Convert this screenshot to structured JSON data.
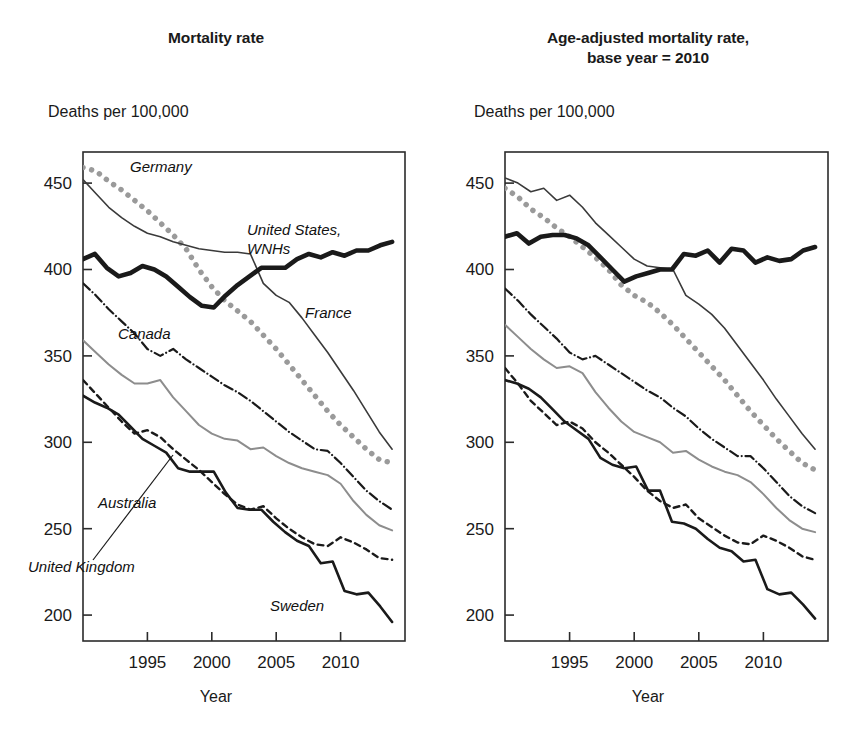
{
  "figure": {
    "width": 864,
    "height": 742,
    "background": "#ffffff"
  },
  "panels": [
    {
      "id": "left",
      "title_line1": "Mortality rate",
      "title_line2": "",
      "y_caption": "Deaths per 100,000",
      "x_caption": "Year"
    },
    {
      "id": "right",
      "title_line1": "Age-adjusted mortality rate,",
      "title_line2": "base year = 2010",
      "y_caption": "Deaths per 100,000",
      "x_caption": "Year"
    }
  ],
  "annotations": {
    "left": [
      {
        "name": "germany",
        "text": "Germany",
        "x": 130,
        "y": 172
      },
      {
        "name": "united-states-wnhs-1",
        "text": "United States,",
        "x": 247,
        "y": 235
      },
      {
        "name": "united-states-wnhs-2",
        "text": "WNHs",
        "x": 247,
        "y": 254
      },
      {
        "name": "france",
        "text": "France",
        "x": 305,
        "y": 318
      },
      {
        "name": "canada",
        "text": "Canada",
        "x": 118,
        "y": 339
      },
      {
        "name": "australia",
        "text": "Australia",
        "x": 98,
        "y": 508
      },
      {
        "name": "united-kingdom",
        "text": "United Kingdom",
        "x": 28,
        "y": 572
      },
      {
        "name": "sweden",
        "text": "Sweden",
        "x": 270,
        "y": 611
      }
    ],
    "right": []
  },
  "axes": {
    "y_ticks": [
      200,
      250,
      300,
      350,
      400,
      450
    ],
    "y_min": 185,
    "y_max": 468,
    "x_ticks": [
      1995,
      2000,
      2005,
      2010
    ],
    "x_min": 1990,
    "x_max": 2015,
    "grid": false,
    "legend_position": "inline-annotations"
  },
  "colors": {
    "black": "#1a1a1a",
    "gray": "#8d8d8d",
    "gray_dot": "#9a9a9a",
    "frame": "#2b2b2b"
  },
  "chart_data": [
    {
      "id": "mortality-rate",
      "type": "line",
      "title": "Mortality rate",
      "xlabel": "Year",
      "ylabel": "Deaths per 100,000",
      "xlim": [
        1990,
        2015
      ],
      "ylim": [
        185,
        468
      ],
      "x": [
        1990,
        1991,
        1992,
        1993,
        1994,
        1995,
        1996,
        1997,
        1998,
        1999,
        2000,
        2001,
        2002,
        2003,
        2004,
        2005,
        2006,
        2007,
        2008,
        2009,
        2010,
        2011,
        2012,
        2013,
        2014
      ],
      "grid": false,
      "series": [
        {
          "name": "Germany",
          "style": "dotted",
          "color": "#9a9a9a",
          "width": 5.5,
          "values": [
            459,
            457,
            451,
            446,
            440,
            434,
            427,
            420,
            412,
            400,
            390,
            382,
            376,
            370,
            362,
            354,
            345,
            336,
            327,
            318,
            310,
            303,
            296,
            290,
            288
          ]
        },
        {
          "name": "France",
          "style": "solid",
          "color": "#3a3a3a",
          "width": 1.6,
          "values": [
            452,
            444,
            436,
            430,
            425,
            421,
            419,
            416,
            414,
            412,
            411,
            410,
            410,
            409,
            392,
            385,
            381,
            372,
            362,
            352,
            341,
            330,
            318,
            306,
            296
          ]
        },
        {
          "name": "United States, WNHs",
          "style": "solid",
          "color": "#1a1a1a",
          "width": 4.6,
          "values": [
            406,
            409,
            401,
            396,
            398,
            402,
            400,
            396,
            390,
            384,
            379,
            378,
            385,
            391,
            396,
            401,
            401,
            401,
            406,
            409,
            407,
            410,
            408,
            411,
            411,
            414,
            416
          ]
        },
        {
          "name": "Canada",
          "style": "dashdot",
          "color": "#1a1a1a",
          "width": 2.2,
          "values": [
            392,
            385,
            377,
            370,
            363,
            354,
            350,
            354,
            348,
            343,
            338,
            333,
            329,
            324,
            318,
            312,
            306,
            301,
            296,
            295,
            288,
            280,
            272,
            266,
            261
          ]
        },
        {
          "name": "United Kingdom",
          "style": "solid",
          "color": "#8d8d8d",
          "width": 2.0,
          "values": [
            359,
            352,
            345,
            339,
            334,
            334,
            336,
            326,
            318,
            310,
            305,
            302,
            301,
            296,
            297,
            292,
            288,
            285,
            283,
            281,
            276,
            266,
            258,
            252,
            249
          ]
        },
        {
          "name": "Sweden",
          "style": "solid",
          "color": "#1a1a1a",
          "width": 2.6,
          "values": [
            327,
            323,
            320,
            316,
            309,
            302,
            298,
            294,
            285,
            283,
            283,
            283,
            271,
            262,
            261,
            261,
            254,
            248,
            243,
            240,
            230,
            231,
            214,
            212,
            213,
            205,
            196
          ]
        },
        {
          "name": "Australia",
          "style": "dashed",
          "color": "#1a1a1a",
          "width": 2.4,
          "values": [
            336,
            328,
            320,
            312,
            305,
            307,
            303,
            296,
            290,
            284,
            277,
            270,
            264,
            261,
            263,
            256,
            250,
            245,
            241,
            240,
            245,
            242,
            238,
            233,
            232
          ]
        }
      ]
    },
    {
      "id": "age-adjusted-mortality-rate",
      "type": "line",
      "title": "Age-adjusted mortality rate, base year = 2010",
      "xlabel": "Year",
      "ylabel": "Deaths per 100,000",
      "xlim": [
        1990,
        2015
      ],
      "ylim": [
        185,
        468
      ],
      "x": [
        1990,
        1991,
        1992,
        1993,
        1994,
        1995,
        1996,
        1997,
        1998,
        1999,
        2000,
        2001,
        2002,
        2003,
        2004,
        2005,
        2006,
        2007,
        2008,
        2009,
        2010,
        2011,
        2012,
        2013,
        2014
      ],
      "grid": false,
      "series": [
        {
          "name": "France",
          "style": "solid",
          "color": "#3a3a3a",
          "width": 1.6,
          "values": [
            453,
            450,
            445,
            447,
            440,
            443,
            436,
            427,
            420,
            413,
            406,
            402,
            401,
            400,
            385,
            380,
            374,
            366,
            356,
            346,
            336,
            325,
            315,
            305,
            296
          ]
        },
        {
          "name": "Germany",
          "style": "dotted",
          "color": "#9a9a9a",
          "width": 5.5,
          "values": [
            447,
            442,
            435,
            430,
            424,
            419,
            413,
            407,
            400,
            391,
            385,
            381,
            375,
            368,
            360,
            352,
            344,
            336,
            327,
            318,
            310,
            302,
            295,
            288,
            284
          ]
        },
        {
          "name": "United States, WNHs",
          "style": "solid",
          "color": "#1a1a1a",
          "width": 4.6,
          "values": [
            419,
            421,
            415,
            419,
            420,
            420,
            418,
            414,
            407,
            400,
            393,
            396,
            398,
            400,
            400,
            409,
            408,
            411,
            404,
            412,
            411,
            404,
            407,
            405,
            406,
            411,
            413
          ]
        },
        {
          "name": "Canada",
          "style": "dashdot",
          "color": "#1a1a1a",
          "width": 2.2,
          "values": [
            389,
            382,
            374,
            367,
            360,
            352,
            348,
            350,
            345,
            340,
            335,
            330,
            326,
            320,
            315,
            308,
            302,
            297,
            292,
            292,
            285,
            277,
            269,
            263,
            259
          ]
        },
        {
          "name": "United Kingdom",
          "style": "solid",
          "color": "#8d8d8d",
          "width": 2.0,
          "values": [
            368,
            361,
            354,
            348,
            343,
            344,
            340,
            329,
            320,
            312,
            306,
            303,
            300,
            294,
            295,
            290,
            286,
            283,
            281,
            277,
            270,
            262,
            255,
            250,
            248
          ]
        },
        {
          "name": "Sweden",
          "style": "solid",
          "color": "#1a1a1a",
          "width": 2.6,
          "values": [
            336,
            334,
            331,
            326,
            319,
            312,
            307,
            302,
            291,
            287,
            285,
            286,
            272,
            272,
            254,
            253,
            250,
            244,
            239,
            237,
            231,
            232,
            215,
            212,
            213,
            206,
            198
          ]
        },
        {
          "name": "Australia",
          "style": "dashed",
          "color": "#1a1a1a",
          "width": 2.4,
          "values": [
            343,
            334,
            324,
            317,
            310,
            312,
            308,
            300,
            294,
            287,
            280,
            272,
            266,
            262,
            264,
            256,
            251,
            246,
            242,
            241,
            246,
            243,
            239,
            234,
            232
          ]
        }
      ]
    }
  ]
}
